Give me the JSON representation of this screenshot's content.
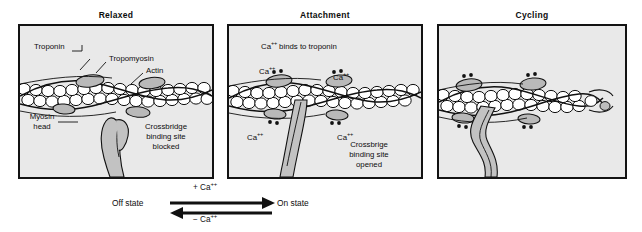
{
  "figure": {
    "panels": [
      {
        "id": "relaxed",
        "title": "Relaxed",
        "labels": {
          "troponin": "Troponin",
          "tropomyosin": "Tropomyosin",
          "actin": "Actin",
          "myosin_head": "Myosin\nhead",
          "myosin_head_line1": "Myosin",
          "myosin_head_line2": "head",
          "crossbridge_line1": "Crossbridge",
          "crossbridge_line2": "binding site",
          "crossbridge_line3": "blocked"
        }
      },
      {
        "id": "attachment",
        "title": "Attachment",
        "labels": {
          "heading": "Ca",
          "heading_sup": "++",
          "heading_rest": " binds to troponin",
          "ca_upper_left": "Ca",
          "ca_upper_right": "Ca",
          "ca_lower_left": "Ca",
          "ca_lower_right": "Ca",
          "ca_sup": "++",
          "crossbridge_line1": "Crossbrige",
          "crossbridge_line2": "binding site",
          "crossbridge_line3": "opened"
        }
      },
      {
        "id": "cycling",
        "title": "Cycling",
        "labels": {}
      }
    ],
    "reaction": {
      "off_state": "Off state",
      "on_state": "On state",
      "forward_sign": "+ ",
      "forward_species": "Ca",
      "forward_sup": "++",
      "reverse_sign": "− ",
      "reverse_species": "Ca",
      "reverse_sup": "++"
    },
    "colors": {
      "panel_background": "#e9e9e9",
      "panel_border": "#131313",
      "ink": "#0d0d0d",
      "protein_fill": "#ffffff",
      "troponin_fill": "#b9b9b9",
      "myosin_fill": "#c2c2c2"
    }
  }
}
